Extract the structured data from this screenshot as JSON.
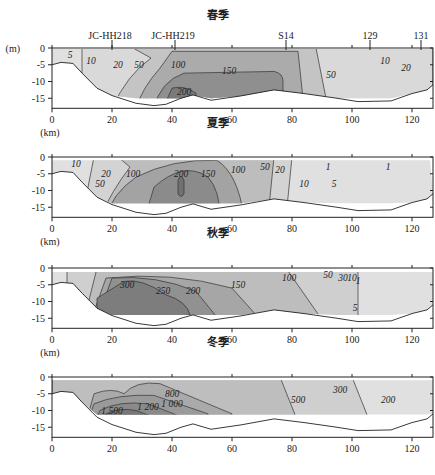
{
  "chart_data": [
    {
      "type": "heatmap",
      "subtype": "contour-section",
      "title": "春季",
      "xlabel": "(km)",
      "ylabel": "(m)",
      "xlim": [
        0,
        127
      ],
      "ylim": [
        -18,
        0
      ],
      "xticks": [
        0,
        20,
        40,
        60,
        80,
        100,
        120
      ],
      "yticks": [
        0,
        -5,
        -10,
        -15
      ],
      "stations": [
        {
          "name": "JC-HH218",
          "x": 20
        },
        {
          "name": "JC-HH219",
          "x": 41
        },
        {
          "name": "S14",
          "x": 78
        },
        {
          "name": "129",
          "x": 106
        },
        {
          "name": "131",
          "x": 123
        }
      ],
      "contour_levels": [
        5,
        10,
        20,
        50,
        100,
        150,
        200
      ],
      "contour_labels": [
        {
          "text": "5",
          "x": 6,
          "y": -2
        },
        {
          "text": "10",
          "x": 13,
          "y": -4
        },
        {
          "text": "20",
          "x": 22,
          "y": -5
        },
        {
          "text": "50",
          "x": 29,
          "y": -5
        },
        {
          "text": "100",
          "x": 42,
          "y": -5
        },
        {
          "text": "150",
          "x": 59,
          "y": -7
        },
        {
          "text": "200",
          "x": 44,
          "y": -13
        },
        {
          "text": "50",
          "x": 93,
          "y": -8
        },
        {
          "text": "10",
          "x": 111,
          "y": -4
        },
        {
          "text": "20",
          "x": 118,
          "y": -6
        }
      ],
      "max_region": "x 35-77 km, depth 8-15 m (>150)"
    },
    {
      "type": "heatmap",
      "subtype": "contour-section",
      "title": "夏季",
      "xlabel": "(km)",
      "xlim": [
        0,
        127
      ],
      "ylim": [
        -18,
        0
      ],
      "xticks": [
        0,
        20,
        40,
        60,
        80,
        100,
        120
      ],
      "yticks": [
        0,
        -5,
        -10,
        -15
      ],
      "contour_levels": [
        1,
        5,
        10,
        20,
        50,
        100,
        150,
        200
      ],
      "contour_labels": [
        {
          "text": "10",
          "x": 8,
          "y": -2
        },
        {
          "text": "20",
          "x": 18,
          "y": -5
        },
        {
          "text": "50",
          "x": 16,
          "y": -8
        },
        {
          "text": "100",
          "x": 27,
          "y": -5
        },
        {
          "text": "200",
          "x": 43,
          "y": -5
        },
        {
          "text": "150",
          "x": 52,
          "y": -5
        },
        {
          "text": "100",
          "x": 62,
          "y": -4
        },
        {
          "text": "50",
          "x": 71,
          "y": -3
        },
        {
          "text": "20",
          "x": 76,
          "y": -4
        },
        {
          "text": "10",
          "x": 84,
          "y": -8
        },
        {
          "text": "5",
          "x": 94,
          "y": -8
        },
        {
          "text": "1",
          "x": 92,
          "y": -3
        },
        {
          "text": "1",
          "x": 112,
          "y": -3
        }
      ],
      "max_region": "x 40-50 km, depth 3-12 m (>200)"
    },
    {
      "type": "heatmap",
      "subtype": "contour-section",
      "title": "秋季",
      "xlabel": "(km)",
      "xlim": [
        0,
        127
      ],
      "ylim": [
        -18,
        0
      ],
      "xticks": [
        0,
        20,
        40,
        60,
        80,
        100,
        120
      ],
      "yticks": [
        0,
        -5,
        -10,
        -15
      ],
      "contour_levels": [
        1,
        5,
        10,
        30,
        50,
        100,
        150,
        200,
        250,
        300
      ],
      "contour_labels": [
        {
          "text": "300",
          "x": 25,
          "y": -5
        },
        {
          "text": "250",
          "x": 37,
          "y": -7
        },
        {
          "text": "200",
          "x": 47,
          "y": -7
        },
        {
          "text": "150",
          "x": 62,
          "y": -5
        },
        {
          "text": "100",
          "x": 79,
          "y": -3
        },
        {
          "text": "50",
          "x": 92,
          "y": -2
        },
        {
          "text": "30",
          "x": 97,
          "y": -3
        },
        {
          "text": "10",
          "x": 100,
          "y": -3
        },
        {
          "text": "1",
          "x": 102,
          "y": -4
        },
        {
          "text": "5",
          "x": 101,
          "y": -12
        }
      ],
      "max_region": "x 15-45 km, depth 5-14 m (>300)"
    },
    {
      "type": "heatmap",
      "subtype": "contour-section",
      "title": "冬季",
      "xlabel": "",
      "xlim": [
        0,
        127
      ],
      "ylim": [
        -18,
        0
      ],
      "xticks": [
        0,
        20,
        40,
        60,
        80,
        100,
        120
      ],
      "yticks": [
        0,
        -5,
        -10,
        -15
      ],
      "contour_levels": [
        200,
        300,
        500,
        800,
        1000,
        1200,
        1500
      ],
      "contour_labels": [
        {
          "text": "800",
          "x": 40,
          "y": -5
        },
        {
          "text": "1 000",
          "x": 40,
          "y": -8
        },
        {
          "text": "1 200",
          "x": 32,
          "y": -9
        },
        {
          "text": "1 500",
          "x": 20,
          "y": -10
        },
        {
          "text": "500",
          "x": 82,
          "y": -7
        },
        {
          "text": "300",
          "x": 96,
          "y": -4
        },
        {
          "text": "200",
          "x": 112,
          "y": -7
        }
      ],
      "max_region": "x 15-30 km, depth 9-11 m (>1500)"
    }
  ],
  "panels": [
    {
      "title": "春季",
      "y_unit": "(m)",
      "x_unit": "(km)"
    },
    {
      "title": "夏季",
      "x_unit": "(km)"
    },
    {
      "title": "秋季",
      "x_unit": "(km)"
    },
    {
      "title": "冬季"
    }
  ]
}
